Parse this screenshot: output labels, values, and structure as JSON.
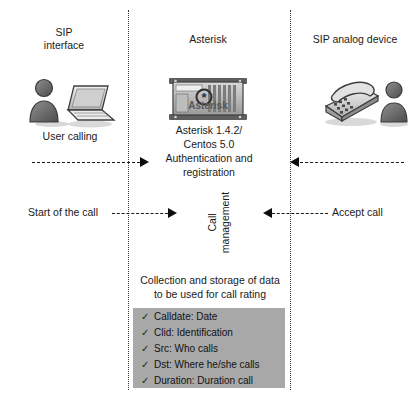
{
  "diagram": {
    "columns": [
      {
        "id": "sip-interface",
        "title": "SIP\ninterface",
        "line1": "SIP",
        "line2": "interface"
      },
      {
        "id": "asterisk",
        "title": "Asterisk"
      },
      {
        "id": "sip-analog-device",
        "title": "SIP analog device"
      }
    ],
    "left": {
      "caption": "User calling",
      "icons": [
        "user-icon",
        "laptop-icon"
      ]
    },
    "center": {
      "server_icon": "asterisk-server-icon",
      "server_logo_text": "Asterisk",
      "version_line1": "Asterisk 1.4.2/",
      "version_line2": "Centos 5.0",
      "auth_line1": "Authentication and",
      "auth_line2": "registration",
      "call_management_line1": "Call",
      "call_management_line2": "management",
      "collection_line1": "Collection and storage of data",
      "collection_line2": "to be used for call rating"
    },
    "right": {
      "icons": [
        "desk-phone-icon",
        "user-icon"
      ]
    },
    "flows": [
      {
        "id": "authentication-flow-left",
        "label": "",
        "direction": "right"
      },
      {
        "id": "authentication-flow-right",
        "label": "",
        "direction": "left"
      },
      {
        "id": "start-call-flow",
        "label": "Start of the call",
        "direction": "right"
      },
      {
        "id": "accept-call-flow",
        "label": "Accept call",
        "direction": "left"
      }
    ],
    "cdr_fields": [
      {
        "check": "✓",
        "label": "Calldate: Date"
      },
      {
        "check": "✓",
        "label": "Clid: Identification"
      },
      {
        "check": "✓",
        "label": "Src: Who calls"
      },
      {
        "check": "✓",
        "label": "Dst: Where he/she calls"
      },
      {
        "check": "✓",
        "label": "Duration: Duration call"
      }
    ],
    "colors": {
      "box_background": "#a8a8a8",
      "lane_line": "#3a3a3a",
      "arrow": "#0d0d0d",
      "text": "#1a1a1a"
    }
  }
}
